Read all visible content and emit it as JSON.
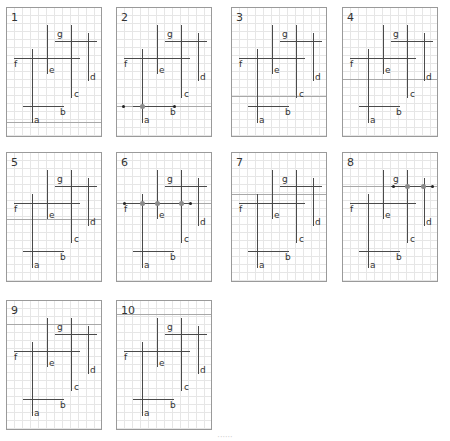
{
  "panels": [
    {
      "number": "1",
      "left": 6,
      "top": 7,
      "sweep_y": 114
    },
    {
      "number": "2",
      "left": 116,
      "top": 7,
      "sweep_y": 98,
      "endpoints": [
        [
          6,
          98
        ],
        [
          57,
          98
        ]
      ],
      "intersections": [
        [
          25,
          98
        ]
      ]
    },
    {
      "number": "3",
      "left": 231,
      "top": 7,
      "sweep_y": 88
    },
    {
      "number": "4",
      "left": 342,
      "top": 7,
      "sweep_y": 71
    },
    {
      "number": "5",
      "left": 6,
      "top": 152,
      "sweep_y": 66
    },
    {
      "number": "6",
      "left": 116,
      "top": 152,
      "sweep_y": 50,
      "endpoints": [
        [
          7,
          50
        ],
        [
          73,
          50
        ]
      ],
      "intersections": [
        [
          25,
          50
        ],
        [
          40,
          50
        ],
        [
          64,
          50
        ]
      ]
    },
    {
      "number": "7",
      "left": 231,
      "top": 152,
      "sweep_y": 41
    },
    {
      "number": "8",
      "left": 342,
      "top": 152,
      "sweep_y": 33,
      "endpoints": [
        [
          50,
          33
        ],
        [
          89,
          33
        ]
      ],
      "intersections": [
        [
          64,
          33
        ],
        [
          80,
          33
        ]
      ]
    },
    {
      "number": "9",
      "left": 6,
      "top": 300,
      "sweep_y": 23
    },
    {
      "number": "10",
      "left": 116,
      "top": 300,
      "sweep_y": 13
    }
  ],
  "segments": {
    "horizontal": [
      {
        "label": "g",
        "y": 33,
        "x1": 48,
        "x2": 90,
        "label_x": 50,
        "label_y": 22
      },
      {
        "label": "f",
        "y": 50,
        "x1": 7,
        "x2": 73,
        "label_x": 7,
        "label_y": 52
      },
      {
        "label": "b",
        "y": 98,
        "x1": 16,
        "x2": 57,
        "label_x": 53,
        "label_y": 100
      }
    ],
    "vertical": [
      {
        "label": "e",
        "x": 40,
        "y1": 17,
        "y2": 66,
        "label_x": 42,
        "label_y": 58
      },
      {
        "label": "c",
        "x": 64,
        "y1": 17,
        "y2": 90,
        "label_x": 67,
        "label_y": 82
      },
      {
        "label": "d",
        "x": 81,
        "y1": 25,
        "y2": 73,
        "label_x": 83,
        "label_y": 65
      },
      {
        "label": "a",
        "x": 25,
        "y1": 41,
        "y2": 115,
        "label_x": 27,
        "label_y": 108
      }
    ]
  },
  "colors": {
    "segment": "#4a4a4a",
    "sweep_line": "#a8a8a8",
    "grid": "#e6e6e6",
    "border": "#9a9a9a",
    "intersection": "#8a8a8a"
  },
  "caption": "······"
}
